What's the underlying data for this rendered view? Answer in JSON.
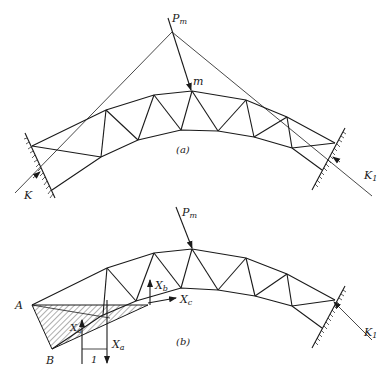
{
  "figure": {
    "panel_a": {
      "caption": "(a)",
      "labels": {
        "load": "P",
        "load_sub": "m",
        "node": "m",
        "left_reaction": "K",
        "right_reaction": "K",
        "right_reaction_sub": "1"
      }
    },
    "panel_b": {
      "caption": "(b)",
      "labels": {
        "load": "P",
        "load_sub": "m",
        "point_a": "A",
        "point_b": "B",
        "xa": "X",
        "xa_sub": "a",
        "xa_left": "X",
        "xa_left_sub": "a",
        "xb": "X",
        "xb_sub": "b",
        "xc": "X",
        "xc_sub": "c",
        "unit_dimension": "1",
        "right_reaction": "K",
        "right_reaction_sub": "1"
      }
    }
  }
}
